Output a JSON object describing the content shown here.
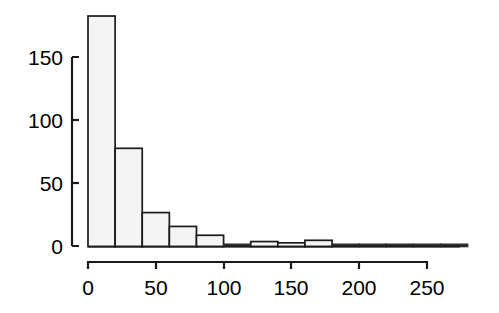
{
  "figure": {
    "background_color": "#ffffff",
    "bar_fill_color": "#f4f4f2",
    "bar_edge_color": "#1a1a1a",
    "axis_color": "#1a1a1a"
  },
  "chart_data": {
    "type": "bar",
    "title": "",
    "subtitle": "",
    "xlabel": "",
    "ylabel": "",
    "histogram": true,
    "bin_width": 20,
    "bin_edges": [
      0,
      20,
      40,
      60,
      80,
      100,
      120,
      140,
      160,
      180,
      200,
      220,
      240,
      260,
      280
    ],
    "categories": [
      "0-20",
      "20-40",
      "40-60",
      "60-80",
      "80-100",
      "100-120",
      "120-140",
      "140-160",
      "160-180",
      "180-200",
      "200-220",
      "220-240",
      "240-260",
      "260-280"
    ],
    "values": [
      183,
      78,
      27,
      16,
      9,
      1,
      4,
      3,
      5,
      0,
      0,
      0,
      1,
      1
    ],
    "xlim": [
      0,
      280
    ],
    "ylim": [
      0,
      190
    ],
    "x_ticks": [
      0,
      50,
      100,
      150,
      200,
      250
    ],
    "x_tick_labels": [
      "0",
      "50",
      "100",
      "150",
      "200",
      "250"
    ],
    "y_ticks": [
      0,
      50,
      100,
      150
    ],
    "y_tick_labels": [
      "0",
      "50",
      "100",
      "150"
    ],
    "grid": false,
    "legend": null,
    "annotations": []
  },
  "axes": {
    "y_tick_labels": [
      "150",
      "100",
      "50",
      "0"
    ],
    "x_tick_labels": [
      "0",
      "50",
      "100",
      "150",
      "200",
      "250"
    ]
  }
}
